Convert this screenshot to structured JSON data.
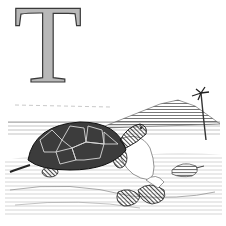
{
  "illustration": {
    "style": "black-and-white wood engraving",
    "decorative_initial": "T",
    "subject": "tortoise on rocky shore",
    "elements": [
      "decorative-initial-T",
      "tortoise",
      "small-turtle",
      "hills",
      "palm-tree",
      "rocks",
      "water",
      "horizon"
    ]
  },
  "colors": {
    "background": "#ffffff",
    "ink": "#2a2a2a",
    "letter_fill": "#b8b8b8",
    "mid_gray": "#8a8a8a",
    "light_gray": "#d4d4d4"
  }
}
